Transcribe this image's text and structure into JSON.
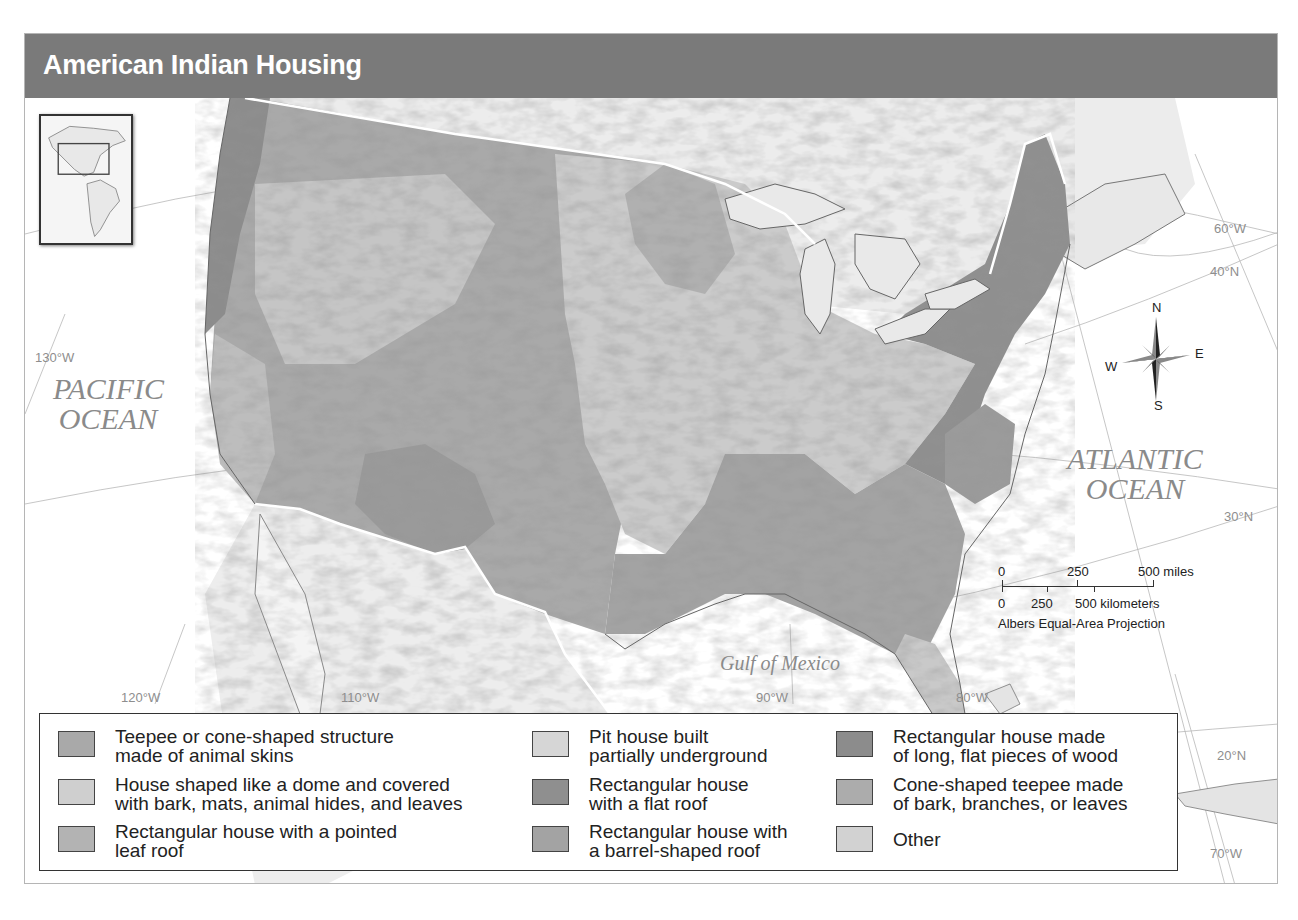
{
  "title": "American Indian Housing",
  "oceans": {
    "pacific": [
      "PACIFIC",
      "OCEAN"
    ],
    "atlantic": [
      "ATLANTIC",
      "OCEAN"
    ],
    "gulf": "Gulf of Mexico"
  },
  "graticule_labels": {
    "w130": "130°W",
    "w120": "120°W",
    "w110": "110°W",
    "w90": "90°W",
    "w80": "80°W",
    "w70": "70°W",
    "w60": "60°W",
    "n40": "40°N",
    "n30": "30°N",
    "n20": "20°N"
  },
  "compass": {
    "n": "N",
    "s": "S",
    "e": "E",
    "w": "W"
  },
  "scale": {
    "miles_0": "0",
    "miles_250": "250",
    "miles_500": "500 miles",
    "km_0": "0",
    "km_250": "250",
    "km_500": "500 kilometers",
    "projection": "Albers Equal-Area Projection"
  },
  "legend": {
    "items": [
      {
        "line1": "Teepee or cone-shaped structure",
        "line2": "made of animal skins",
        "color": "#a9a9a9"
      },
      {
        "line1": "House shaped like a dome and covered",
        "line2": "with bark, mats, animal hides, and leaves",
        "color": "#cfcfcf"
      },
      {
        "line1": "Rectangular house with a pointed",
        "line2": "leaf roof",
        "color": "#b3b3b3"
      },
      {
        "line1": "Pit house built",
        "line2": "partially underground",
        "color": "#d6d6d6"
      },
      {
        "line1": "Rectangular house",
        "line2": "with a flat roof",
        "color": "#8f8f8f"
      },
      {
        "line1": "Rectangular house with",
        "line2": "a barrel-shaped roof",
        "color": "#a3a3a3"
      },
      {
        "line1": "Rectangular house made",
        "line2": "of long, flat pieces of wood",
        "color": "#8c8c8c"
      },
      {
        "line1": "Cone-shaped teepee made",
        "line2": "of bark, branches, or leaves",
        "color": "#acacac"
      },
      {
        "line1": "Other",
        "line2": "",
        "color": "#d2d2d2"
      }
    ]
  },
  "colors": {
    "title_bar": "#7a7a7a",
    "ocean": "#ffffff",
    "foreign_land": "#e6e6e6"
  }
}
